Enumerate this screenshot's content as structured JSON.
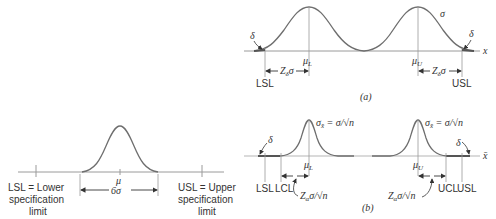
{
  "figure_left": {
    "mean_label": "μ",
    "spread_label": "6σ",
    "lsl_label": [
      "LSL = Lower",
      "specification",
      "limit"
    ],
    "usl_label": [
      "USL = Upper",
      "specification",
      "limit"
    ]
  },
  "panel_a": {
    "caption": "(a)",
    "axis_label": "x",
    "sigma_label": "σ",
    "delta_left": "δ",
    "delta_right": "δ",
    "mu_lower": "μ",
    "mu_lower_sub": "L",
    "mu_upper": "μ",
    "mu_upper_sub": "U",
    "z_left": "Z",
    "z_left_sub": "δ",
    "z_left_tail": "σ",
    "z_right": "Z",
    "z_right_sub": "δ",
    "z_right_tail": "σ",
    "lsl": "LSL",
    "usl": "USL"
  },
  "panel_b": {
    "caption": "(b)",
    "axis_label": "x̄",
    "sigma_xbar_left": "σ",
    "sigma_xbar_left_sub": "x̄",
    "sigma_xbar_left_eq": " = σ/√n",
    "sigma_xbar_right": "σ",
    "sigma_xbar_right_sub": "x̄",
    "sigma_xbar_right_eq": " = σ/√n",
    "delta_left": "δ",
    "delta_right": "δ",
    "mu_lower": "μ",
    "mu_lower_sub": "L",
    "mu_upper": "μ",
    "mu_upper_sub": "U",
    "z_left": "Z",
    "z_left_sub": "α",
    "z_left_tail": "σ/√n",
    "z_right": "Z",
    "z_right_sub": "α",
    "z_right_tail": "σ/√n",
    "lsl": "LSL",
    "lcl": "LCL",
    "ucl": "UCL",
    "usl": "USL"
  },
  "colors": {
    "curve": "#6e6e6e",
    "axis": "#9a9a9a",
    "text": "#333333",
    "tail": "#555555"
  }
}
